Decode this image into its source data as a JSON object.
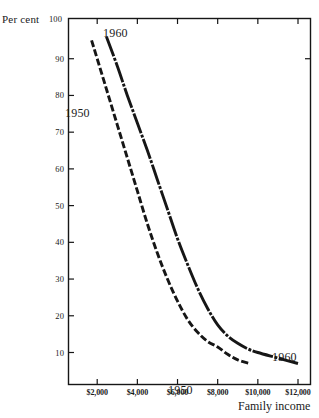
{
  "cut_caption": "",
  "chart_data": {
    "type": "line",
    "title": "",
    "xlabel": "Family income",
    "ylabel": "Per cent",
    "xlim": [
      1000,
      12500
    ],
    "ylim": [
      3,
      100
    ],
    "grid": false,
    "legend_position": "inline-annotations",
    "x_tick_labels": [
      "$2,000",
      "$4,000",
      "$6,000",
      "$8,000",
      "$10,000",
      "$12,000"
    ],
    "x_tick_values": [
      2000,
      4000,
      6000,
      8000,
      10000,
      12000
    ],
    "y_tick_labels": [
      "10",
      "20",
      "30",
      "40",
      "50",
      "60",
      "70",
      "80",
      "90",
      "100"
    ],
    "y_tick_values": [
      10,
      20,
      30,
      40,
      50,
      60,
      70,
      80,
      90,
      100
    ],
    "series": [
      {
        "name": "1950",
        "style": "dashed",
        "color": "#161616",
        "x": [
          1720,
          2000,
          2500,
          3000,
          3500,
          4000,
          4500,
          5000,
          5500,
          6000,
          6500,
          7000,
          7500,
          8000,
          8500,
          9000,
          9600
        ],
        "values": [
          95,
          90,
          81,
          72,
          63,
          54,
          45,
          37,
          30,
          24,
          19,
          15.5,
          13,
          11.5,
          9.5,
          8,
          7
        ]
      },
      {
        "name": "1960",
        "style": "solid",
        "color": "#161616",
        "x": [
          2460,
          3000,
          3500,
          4000,
          4500,
          5000,
          5500,
          6000,
          6500,
          7000,
          7500,
          8000,
          8500,
          9000,
          9500,
          10000,
          11000,
          12000
        ],
        "values": [
          96,
          88,
          80,
          72.5,
          65,
          57,
          49,
          41,
          34,
          27.5,
          22,
          17.5,
          14.5,
          12.5,
          11,
          10,
          8.5,
          7
        ]
      }
    ],
    "annotations": [
      {
        "text": "1960",
        "x_px": 103,
        "y_px": 26
      },
      {
        "text": "1950",
        "x_px": 65,
        "y_px": 106
      },
      {
        "text": "1950",
        "x_px": 168,
        "y_px": 383
      },
      {
        "text": "1960",
        "x_px": 272,
        "y_px": 350
      }
    ]
  }
}
